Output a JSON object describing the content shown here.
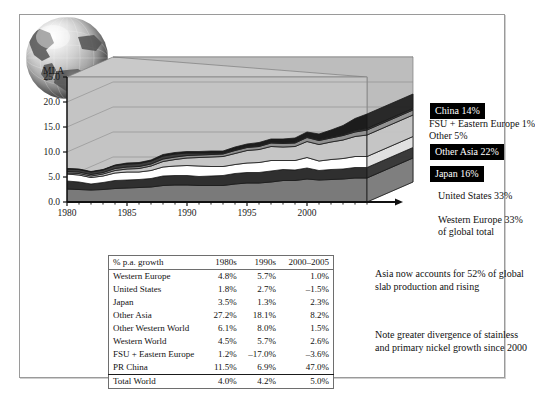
{
  "figure": {
    "axis_unit_label": "MLA"
  },
  "chart_data": {
    "type": "area",
    "title": "",
    "subtitle": "",
    "xlabel": "",
    "ylabel": "MLA",
    "ylim": [
      0.0,
      25.0
    ],
    "xlim": [
      1980,
      2005
    ],
    "ytick_labels": [
      "25.0",
      "20.0",
      "15.0",
      "10.0",
      "5.0",
      "0.0"
    ],
    "ytick_values": [
      25.0,
      20.0,
      15.0,
      10.0,
      5.0,
      0.0
    ],
    "xtick_labels": [
      "1980",
      "1985",
      "1990",
      "1995",
      "2000"
    ],
    "xtick_values": [
      1980,
      1985,
      1990,
      1995,
      2000
    ],
    "grid": true,
    "stacked": true,
    "legend_position": "right",
    "x": [
      1980,
      1981,
      1982,
      1983,
      1984,
      1985,
      1986,
      1987,
      1988,
      1989,
      1990,
      1991,
      1992,
      1993,
      1994,
      1995,
      1996,
      1997,
      1998,
      1999,
      2000,
      2001,
      2002,
      2003,
      2004,
      2005
    ],
    "series": [
      {
        "name": "Western Europe",
        "color": "#7a7a7a",
        "values": [
          2.6,
          2.5,
          2.4,
          2.5,
          2.7,
          2.8,
          2.9,
          3.0,
          3.3,
          3.4,
          3.4,
          3.3,
          3.3,
          3.3,
          3.6,
          3.8,
          3.8,
          4.0,
          4.3,
          4.3,
          4.6,
          4.4,
          4.5,
          4.6,
          4.8,
          4.8
        ]
      },
      {
        "name": "United States",
        "color": "#2f2f2f",
        "values": [
          1.6,
          1.5,
          1.2,
          1.4,
          1.6,
          1.6,
          1.6,
          1.7,
          1.9,
          1.9,
          1.9,
          1.8,
          1.9,
          2.0,
          2.1,
          2.1,
          2.1,
          2.2,
          2.2,
          2.1,
          2.2,
          1.9,
          2.0,
          2.0,
          2.1,
          2.1
        ]
      },
      {
        "name": "Japan",
        "color": "#ffffff",
        "values": [
          1.4,
          1.4,
          1.3,
          1.3,
          1.5,
          1.6,
          1.5,
          1.6,
          1.8,
          1.9,
          2.0,
          2.1,
          1.9,
          1.8,
          1.8,
          1.9,
          2.0,
          2.1,
          1.8,
          1.9,
          2.1,
          1.9,
          2.0,
          2.1,
          2.2,
          2.2
        ]
      },
      {
        "name": "Other Asia",
        "color": "#c6c6c6",
        "values": [
          0.2,
          0.3,
          0.3,
          0.4,
          0.5,
          0.6,
          0.7,
          0.9,
          1.1,
          1.3,
          1.5,
          1.7,
          1.9,
          2.0,
          2.2,
          2.5,
          2.6,
          2.8,
          2.7,
          2.8,
          3.2,
          3.3,
          3.5,
          3.7,
          4.0,
          4.3
        ]
      },
      {
        "name": "Other",
        "color": "#8f8f8f",
        "values": [
          0.3,
          0.3,
          0.3,
          0.3,
          0.4,
          0.4,
          0.4,
          0.4,
          0.5,
          0.5,
          0.5,
          0.5,
          0.5,
          0.5,
          0.6,
          0.6,
          0.6,
          0.7,
          0.7,
          0.7,
          0.8,
          0.8,
          0.8,
          0.9,
          0.9,
          1.0
        ]
      },
      {
        "name": "FSU + Eastern Europe",
        "color": "#3d3d3d",
        "values": [
          0.5,
          0.5,
          0.5,
          0.5,
          0.6,
          0.6,
          0.6,
          0.6,
          0.6,
          0.6,
          0.5,
          0.4,
          0.3,
          0.2,
          0.2,
          0.2,
          0.2,
          0.2,
          0.2,
          0.2,
          0.2,
          0.2,
          0.2,
          0.2,
          0.3,
          0.3
        ]
      },
      {
        "name": "China",
        "color": "#1c1c1c",
        "values": [
          0.1,
          0.1,
          0.1,
          0.1,
          0.1,
          0.2,
          0.2,
          0.2,
          0.3,
          0.3,
          0.3,
          0.3,
          0.4,
          0.4,
          0.5,
          0.5,
          0.6,
          0.6,
          0.7,
          0.8,
          0.9,
          1.1,
          1.4,
          1.8,
          2.4,
          2.9
        ]
      }
    ]
  },
  "legend": [
    {
      "label": "China 14%",
      "style": "boxed"
    },
    {
      "label": "FSU + Eastern Europe 1%",
      "style": "plain"
    },
    {
      "label": "Other 5%",
      "style": "plain"
    },
    {
      "label": "Other Asia 22%",
      "style": "boxed"
    },
    {
      "label": "Japan 16%",
      "style": "boxed"
    },
    {
      "label": "United States 33%",
      "style": "plain"
    },
    {
      "label": "Western Europe 33%",
      "style": "plain"
    },
    {
      "label": "of global total",
      "style": "plain"
    }
  ],
  "table": {
    "headers": [
      "% p.a. growth",
      "1980s",
      "1990s",
      "2000–2005"
    ],
    "rows": [
      {
        "region": "Western Europe",
        "d1980s": "4.8%",
        "d1990s": "5.7%",
        "d2000_2005": "1.0%"
      },
      {
        "region": "United States",
        "d1980s": "1.8%",
        "d1990s": "2.7%",
        "d2000_2005": "–1.5%"
      },
      {
        "region": "Japan",
        "d1980s": "3.5%",
        "d1990s": "1.3%",
        "d2000_2005": "2.3%"
      },
      {
        "region": "Other Asia",
        "d1980s": "27.2%",
        "d1990s": "18.1%",
        "d2000_2005": "8.2%"
      },
      {
        "region": "Other Western World",
        "d1980s": "6.1%",
        "d1990s": "8.0%",
        "d2000_2005": "1.5%"
      },
      {
        "region": "Western World",
        "d1980s": "4.5%",
        "d1990s": "5.7%",
        "d2000_2005": "2.6%"
      },
      {
        "region": "FSU + Eastern Europe",
        "d1980s": "1.2%",
        "d1990s": "–17.0%",
        "d2000_2005": "–3.6%"
      },
      {
        "region": "PR China",
        "d1980s": "11.5%",
        "d1990s": "6.9%",
        "d2000_2005": "47.0%"
      }
    ],
    "total": {
      "region": "Total World",
      "d1980s": "4.0%",
      "d1990s": "4.2%",
      "d2000_2005": "5.0%"
    }
  },
  "notes": {
    "asia": "Asia now accounts for 52% of global slab production and rising",
    "nickel": "Note greater divergence of stainless and primary nickel growth since 2000"
  }
}
